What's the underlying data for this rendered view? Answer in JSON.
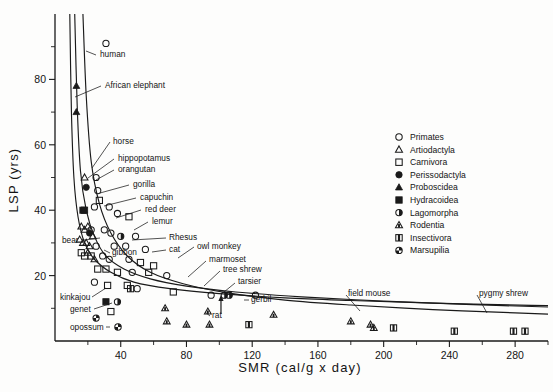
{
  "chart_data": {
    "type": "scatter",
    "title": "",
    "xlabel": "SMR  (cal/g x day)",
    "ylabel": "LSP  (yrs)",
    "xlim": [
      0,
      300
    ],
    "ylim": [
      0,
      100
    ],
    "xticks_labeled": [
      40,
      80,
      120,
      160,
      200,
      240,
      280
    ],
    "xticks_minor": [
      20,
      60,
      100,
      140,
      180,
      220,
      260,
      300
    ],
    "yticks_labeled": [
      20,
      40,
      60,
      80
    ],
    "yticks_minor": [
      10,
      30,
      50,
      70,
      90
    ],
    "grid": false,
    "legend_position": "upper right",
    "legend": [
      {
        "label": "Primates",
        "marker": "open-circle"
      },
      {
        "label": "Artiodactyla",
        "marker": "open-triangle"
      },
      {
        "label": "Carnivora",
        "marker": "open-square"
      },
      {
        "label": "Perissodactyla",
        "marker": "filled-circle"
      },
      {
        "label": "Proboscidea",
        "marker": "filled-triangle"
      },
      {
        "label": "Hydracoidea",
        "marker": "filled-square"
      },
      {
        "label": "Lagomorpha",
        "marker": "half-circle"
      },
      {
        "label": "Rodentia",
        "marker": "dotted-triangle"
      },
      {
        "label": "Insectivora",
        "marker": "split-square"
      },
      {
        "label": "Marsupilia",
        "marker": "quarter-circle"
      }
    ],
    "annotations": [
      {
        "text": "human",
        "x": 27,
        "y": 91
      },
      {
        "text": "African elephant",
        "x": 22,
        "y": 81
      },
      {
        "text": "horse",
        "x": 26,
        "y": 60
      },
      {
        "text": "hippopotamus",
        "x": 28,
        "y": 55
      },
      {
        "text": "orangutan",
        "x": 30,
        "y": 50
      },
      {
        "text": "gorilla",
        "x": 33,
        "y": 47
      },
      {
        "text": "capuchin",
        "x": 38,
        "y": 44
      },
      {
        "text": "red deer",
        "x": 38,
        "y": 41
      },
      {
        "text": "lemur",
        "x": 40,
        "y": 38
      },
      {
        "text": "bear",
        "x": 25,
        "y": 33
      },
      {
        "text": "gibbon",
        "x": 41,
        "y": 31
      },
      {
        "text": "Rhesus",
        "x": 53,
        "y": 34
      },
      {
        "text": "cat",
        "x": 54,
        "y": 31
      },
      {
        "text": "owl monkey",
        "x": 70,
        "y": 31
      },
      {
        "text": "marmoset",
        "x": 75,
        "y": 28
      },
      {
        "text": "tree shrew",
        "x": 86,
        "y": 27
      },
      {
        "text": "tarsier",
        "x": 95,
        "y": 24
      },
      {
        "text": "kinkajou",
        "x": 17,
        "y": 15
      },
      {
        "text": "genet",
        "x": 20,
        "y": 12
      },
      {
        "text": "opossum",
        "x": 18,
        "y": 7
      },
      {
        "text": "rat",
        "x": 107,
        "y": 8
      },
      {
        "text": "gerbil",
        "x": 128,
        "y": 14
      },
      {
        "text": "field mouse",
        "x": 188,
        "y": 15
      },
      {
        "text": "pygmy shrew",
        "x": 272,
        "y": 15
      }
    ],
    "curves": [
      {
        "name": "upper-isocline",
        "points": [
          [
            9,
            100
          ],
          [
            10,
            70
          ],
          [
            11.5,
            50
          ],
          [
            14,
            38
          ],
          [
            18,
            30
          ],
          [
            24,
            25
          ],
          [
            34,
            21
          ],
          [
            48,
            18
          ],
          [
            70,
            16
          ],
          [
            100,
            14.5
          ],
          [
            140,
            13.2
          ],
          [
            180,
            12.4
          ],
          [
            230,
            11.6
          ],
          [
            290,
            10.9
          ],
          [
            300,
            10.8
          ]
        ]
      },
      {
        "name": "middle-isocline",
        "points": [
          [
            12,
            100
          ],
          [
            13.5,
            72
          ],
          [
            15.5,
            52
          ],
          [
            19,
            40
          ],
          [
            24,
            32
          ],
          [
            31,
            26
          ],
          [
            42,
            22
          ],
          [
            58,
            19
          ],
          [
            80,
            16.8
          ],
          [
            110,
            15
          ],
          [
            150,
            13.5
          ],
          [
            200,
            12.2
          ],
          [
            250,
            11.2
          ],
          [
            300,
            10.4
          ]
        ]
      },
      {
        "name": "lower-isocline",
        "points": [
          [
            17,
            100
          ],
          [
            19,
            75
          ],
          [
            22,
            55
          ],
          [
            27,
            42
          ],
          [
            34,
            33
          ],
          [
            44,
            26
          ],
          [
            58,
            21
          ],
          [
            78,
            17.5
          ],
          [
            104,
            14.8
          ],
          [
            140,
            12.5
          ],
          [
            180,
            11
          ],
          [
            230,
            9.6
          ],
          [
            280,
            8.6
          ],
          [
            300,
            8.2
          ]
        ]
      }
    ],
    "points": [
      {
        "x": 31,
        "y": 91,
        "marker": "open-circle"
      },
      {
        "x": 13,
        "y": 78,
        "marker": "filled-triangle"
      },
      {
        "x": 13,
        "y": 70,
        "marker": "filled-triangle"
      },
      {
        "x": 18,
        "y": 50,
        "marker": "open-triangle"
      },
      {
        "x": 25,
        "y": 50,
        "marker": "open-circle"
      },
      {
        "x": 19,
        "y": 47,
        "marker": "filled-circle"
      },
      {
        "x": 26,
        "y": 46,
        "marker": "open-circle"
      },
      {
        "x": 27,
        "y": 43,
        "marker": "open-square"
      },
      {
        "x": 17,
        "y": 40,
        "marker": "filled-square"
      },
      {
        "x": 18,
        "y": 40,
        "marker": "filled-square"
      },
      {
        "x": 24,
        "y": 41,
        "marker": "open-circle"
      },
      {
        "x": 33,
        "y": 41,
        "marker": "open-circle"
      },
      {
        "x": 38,
        "y": 39,
        "marker": "open-circle"
      },
      {
        "x": 45,
        "y": 38,
        "marker": "open-square"
      },
      {
        "x": 16,
        "y": 35,
        "marker": "open-triangle"
      },
      {
        "x": 18,
        "y": 34,
        "marker": "open-triangle"
      },
      {
        "x": 20,
        "y": 35,
        "marker": "open-triangle"
      },
      {
        "x": 21,
        "y": 33,
        "marker": "filled-circle"
      },
      {
        "x": 22,
        "y": 34,
        "marker": "open-circle"
      },
      {
        "x": 23,
        "y": 32,
        "marker": "open-triangle"
      },
      {
        "x": 30,
        "y": 34,
        "marker": "open-circle"
      },
      {
        "x": 34,
        "y": 33,
        "marker": "open-circle"
      },
      {
        "x": 40,
        "y": 32,
        "marker": "half-circle"
      },
      {
        "x": 49,
        "y": 32,
        "marker": "open-circle"
      },
      {
        "x": 15,
        "y": 31,
        "marker": "open-triangle"
      },
      {
        "x": 17,
        "y": 30,
        "marker": "open-triangle"
      },
      {
        "x": 19,
        "y": 30,
        "marker": "open-triangle"
      },
      {
        "x": 21,
        "y": 29,
        "marker": "open-triangle"
      },
      {
        "x": 25,
        "y": 29,
        "marker": "open-circle"
      },
      {
        "x": 36,
        "y": 29,
        "marker": "open-circle"
      },
      {
        "x": 43,
        "y": 29,
        "marker": "open-circle"
      },
      {
        "x": 55,
        "y": 28,
        "marker": "open-circle"
      },
      {
        "x": 16,
        "y": 27,
        "marker": "open-square"
      },
      {
        "x": 18,
        "y": 26,
        "marker": "open-square"
      },
      {
        "x": 20,
        "y": 27,
        "marker": "open-triangle"
      },
      {
        "x": 22,
        "y": 26,
        "marker": "open-square"
      },
      {
        "x": 24,
        "y": 25,
        "marker": "open-triangle"
      },
      {
        "x": 29,
        "y": 26,
        "marker": "open-circle"
      },
      {
        "x": 33,
        "y": 25,
        "marker": "open-circle"
      },
      {
        "x": 45,
        "y": 25,
        "marker": "open-circle"
      },
      {
        "x": 52,
        "y": 24,
        "marker": "open-square"
      },
      {
        "x": 60,
        "y": 23,
        "marker": "open-square"
      },
      {
        "x": 26,
        "y": 22,
        "marker": "open-square"
      },
      {
        "x": 31,
        "y": 22,
        "marker": "open-square"
      },
      {
        "x": 38,
        "y": 21,
        "marker": "open-square"
      },
      {
        "x": 47,
        "y": 21,
        "marker": "open-circle"
      },
      {
        "x": 57,
        "y": 21,
        "marker": "open-square"
      },
      {
        "x": 68,
        "y": 20,
        "marker": "open-circle"
      },
      {
        "x": 24,
        "y": 18,
        "marker": "open-circle"
      },
      {
        "x": 32,
        "y": 17,
        "marker": "open-square"
      },
      {
        "x": 44,
        "y": 17,
        "marker": "open-square"
      },
      {
        "x": 46,
        "y": 16,
        "marker": "split-square"
      },
      {
        "x": 50,
        "y": 16,
        "marker": "open-circle"
      },
      {
        "x": 72,
        "y": 15,
        "marker": "open-square"
      },
      {
        "x": 95,
        "y": 14,
        "marker": "open-circle"
      },
      {
        "x": 103,
        "y": 14,
        "marker": "half-circle"
      },
      {
        "x": 106,
        "y": 14,
        "marker": "half-circle"
      },
      {
        "x": 122,
        "y": 14,
        "marker": "open-circle"
      },
      {
        "x": 31,
        "y": 12,
        "marker": "filled-square"
      },
      {
        "x": 38,
        "y": 12,
        "marker": "half-circle"
      },
      {
        "x": 34,
        "y": 9,
        "marker": "open-square"
      },
      {
        "x": 25,
        "y": 7,
        "marker": "quarter-circle"
      },
      {
        "x": 67,
        "y": 10,
        "marker": "dotted-triangle"
      },
      {
        "x": 68,
        "y": 6,
        "marker": "dotted-triangle"
      },
      {
        "x": 80,
        "y": 5,
        "marker": "dotted-triangle"
      },
      {
        "x": 93,
        "y": 9,
        "marker": "dotted-triangle"
      },
      {
        "x": 94,
        "y": 5,
        "marker": "dotted-triangle"
      },
      {
        "x": 118,
        "y": 5,
        "marker": "split-square"
      },
      {
        "x": 133,
        "y": 8,
        "marker": "dotted-triangle"
      },
      {
        "x": 180,
        "y": 6,
        "marker": "dotted-triangle"
      },
      {
        "x": 192,
        "y": 5,
        "marker": "dotted-triangle"
      },
      {
        "x": 194,
        "y": 4,
        "marker": "dotted-triangle"
      },
      {
        "x": 206,
        "y": 4,
        "marker": "split-square"
      },
      {
        "x": 243,
        "y": 3,
        "marker": "split-square"
      },
      {
        "x": 279,
        "y": 3,
        "marker": "split-square"
      },
      {
        "x": 286,
        "y": 3,
        "marker": "split-square"
      }
    ],
    "arrow_marker": {
      "x": 101,
      "y": 11
    }
  }
}
